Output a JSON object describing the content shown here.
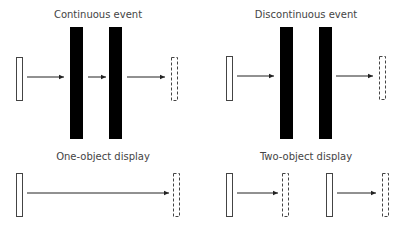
{
  "panels": {
    "continuous": {
      "title": "Continuous event"
    },
    "discontinuous": {
      "title": "Discontinuous event"
    },
    "one_object": {
      "title": "One-object display"
    },
    "two_object": {
      "title": "Two-object display"
    }
  },
  "colors": {
    "occluder": "#000000",
    "outline": "#444444",
    "text": "#444444"
  }
}
